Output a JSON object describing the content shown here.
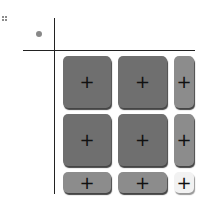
{
  "figure": {
    "corner_marker": "dotted-mark",
    "header_dot": "filled-circle",
    "grid": {
      "rows": 3,
      "cols": 3,
      "tiles": [
        {
          "row": 0,
          "col": 0,
          "shade": "dark",
          "symbol": "+",
          "color": "#6f6f6f"
        },
        {
          "row": 0,
          "col": 1,
          "shade": "dark",
          "symbol": "+",
          "color": "#6f6f6f"
        },
        {
          "row": 0,
          "col": 2,
          "shade": "mid",
          "symbol": "+",
          "color": "#8c8c8c"
        },
        {
          "row": 1,
          "col": 0,
          "shade": "dark",
          "symbol": "+",
          "color": "#6f6f6f"
        },
        {
          "row": 1,
          "col": 1,
          "shade": "dark",
          "symbol": "+",
          "color": "#6f6f6f"
        },
        {
          "row": 1,
          "col": 2,
          "shade": "mid",
          "symbol": "+",
          "color": "#8c8c8c"
        },
        {
          "row": 2,
          "col": 0,
          "shade": "mid",
          "symbol": "+",
          "color": "#8c8c8c"
        },
        {
          "row": 2,
          "col": 1,
          "shade": "mid",
          "symbol": "+",
          "color": "#8c8c8c"
        },
        {
          "row": 2,
          "col": 2,
          "shade": "light",
          "symbol": "+",
          "color": "#f2f2f2"
        }
      ]
    }
  }
}
